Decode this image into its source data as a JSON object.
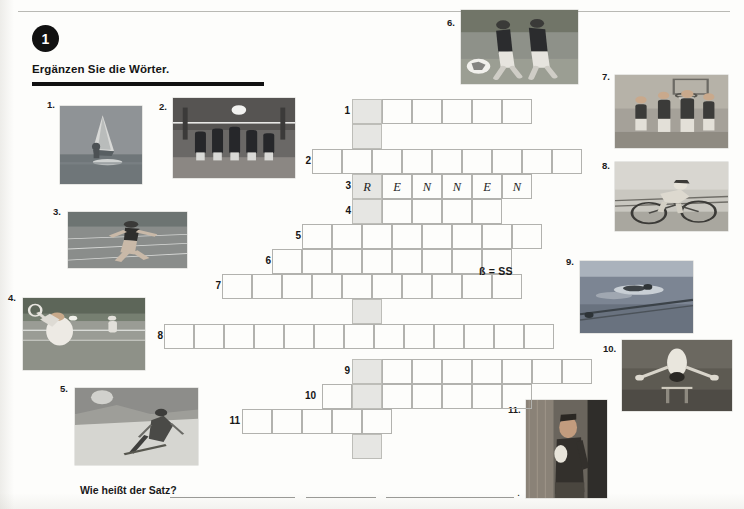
{
  "page": {
    "exercise_number": "1",
    "instruction": "Ergänzen Sie die Wörter.",
    "note": "ß = SS",
    "bottom_question": "Wie heißt der Satz?",
    "bottom_period": "."
  },
  "photos": [
    {
      "num": "1.",
      "alt": "windsurfing",
      "x": 60,
      "y": 106,
      "w": 82,
      "h": 78,
      "num_x": 47,
      "num_y": 99
    },
    {
      "num": "2.",
      "alt": "volleyball",
      "x": 173,
      "y": 98,
      "w": 122,
      "h": 80,
      "num_x": 159,
      "num_y": 101
    },
    {
      "num": "3.",
      "alt": "running",
      "x": 68,
      "y": 212,
      "w": 119,
      "h": 56,
      "num_x": 53,
      "num_y": 206
    },
    {
      "num": "4.",
      "alt": "tennis",
      "x": 23,
      "y": 298,
      "w": 122,
      "h": 72,
      "num_x": 8,
      "num_y": 292
    },
    {
      "num": "5.",
      "alt": "skiing",
      "x": 75,
      "y": 388,
      "w": 123,
      "h": 77,
      "num_x": 60,
      "num_y": 383
    },
    {
      "num": "6.",
      "alt": "soccer",
      "x": 461,
      "y": 10,
      "w": 117,
      "h": 74,
      "num_x": 447,
      "num_y": 17
    },
    {
      "num": "7.",
      "alt": "basketball",
      "x": 615,
      "y": 75,
      "w": 113,
      "h": 73,
      "num_x": 602,
      "num_y": 71
    },
    {
      "num": "8.",
      "alt": "cycling",
      "x": 615,
      "y": 162,
      "w": 113,
      "h": 69,
      "num_x": 602,
      "num_y": 160
    },
    {
      "num": "9.",
      "alt": "swimming",
      "x": 580,
      "y": 261,
      "w": 113,
      "h": 72,
      "num_x": 566,
      "num_y": 256
    },
    {
      "num": "10.",
      "alt": "gymnastics",
      "x": 622,
      "y": 340,
      "w": 110,
      "h": 71,
      "num_x": 603,
      "num_y": 343
    },
    {
      "num": "11.",
      "alt": "boxing",
      "x": 526,
      "y": 400,
      "w": 81,
      "h": 98,
      "num_x": 508,
      "num_y": 404
    }
  ],
  "crossword": {
    "cell_w": 30,
    "cell_h": 25,
    "origin_x": 352,
    "highlight_col_x": 352,
    "rows": [
      {
        "num": "1",
        "start_x": 352,
        "cells": 6,
        "letters": [
          "",
          "",
          "",
          "",
          "",
          ""
        ],
        "y": 99,
        "num_x": 334,
        "num_y": 105
      },
      {
        "num": "2",
        "start_x": 312,
        "cells": 9,
        "letters": [
          "",
          "",
          "",
          "",
          "",
          "",
          "",
          "",
          ""
        ],
        "y": 149,
        "num_x": 295,
        "num_y": 155
      },
      {
        "num": "3",
        "start_x": 352,
        "cells": 6,
        "letters": [
          "R",
          "E",
          "N",
          "N",
          "E",
          "N"
        ],
        "y": 174,
        "num_x": 335,
        "num_y": 180
      },
      {
        "num": "4",
        "start_x": 352,
        "cells": 5,
        "letters": [
          "",
          "",
          "",
          "",
          ""
        ],
        "y": 199,
        "num_x": 335,
        "num_y": 205
      },
      {
        "num": "5",
        "start_x": 302,
        "cells": 8,
        "letters": [
          "",
          "",
          "",
          "",
          "",
          "",
          "",
          ""
        ],
        "y": 224,
        "num_x": 285,
        "num_y": 230
      },
      {
        "num": "6",
        "start_x": 272,
        "cells": 8,
        "letters": [
          "",
          "",
          "",
          "",
          "",
          "",
          "",
          ""
        ],
        "y": 249,
        "num_x": 255,
        "num_y": 255
      },
      {
        "num": "7",
        "start_x": 222,
        "cells": 10,
        "letters": [
          "",
          "",
          "",
          "",
          "",
          "",
          "",
          "",
          "",
          ""
        ],
        "y": 274,
        "num_x": 205,
        "num_y": 280
      },
      {
        "num": "8",
        "start_x": 164,
        "cells": 13,
        "letters": [
          "",
          "",
          "",
          "",
          "",
          "",
          "",
          "",
          "",
          "",
          "",
          "",
          ""
        ],
        "y": 324,
        "num_x": 147,
        "num_y": 330
      },
      {
        "num": "9",
        "start_x": 352,
        "cells": 8,
        "letters": [
          "",
          "",
          "",
          "",
          "",
          "",
          "",
          ""
        ],
        "y": 359,
        "num_x": 334,
        "num_y": 365
      },
      {
        "num": "10",
        "start_x": 322,
        "cells": 7,
        "letters": [
          "",
          "",
          "",
          "",
          "",
          "",
          ""
        ],
        "y": 384,
        "num_x": 300,
        "num_y": 390
      },
      {
        "num": "11",
        "start_x": 242,
        "cells": 5,
        "letters": [
          "",
          "",
          "",
          "",
          ""
        ],
        "y": 409,
        "num_x": 224,
        "num_y": 415
      }
    ],
    "highlight_extra_rows_y": [
      124,
      299,
      434
    ]
  },
  "answer_blanks": [
    {
      "x": 170,
      "y": 497,
      "w": 125
    },
    {
      "x": 306,
      "y": 497,
      "w": 70
    },
    {
      "x": 386,
      "y": 497,
      "w": 128
    }
  ]
}
